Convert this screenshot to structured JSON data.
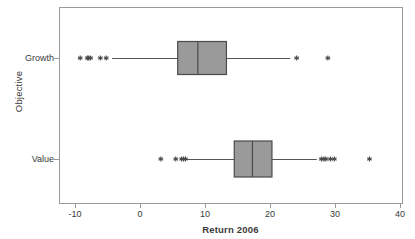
{
  "chart_data": {
    "type": "box",
    "title": "",
    "xlabel": "Return 2006",
    "ylabel": "Objective",
    "orientation": "horizontal",
    "grid": false,
    "legend": "none",
    "xlim": [
      -13,
      41
    ],
    "xticks": [
      -10,
      0,
      10,
      20,
      30,
      40
    ],
    "xtick_labels": [
      "-10",
      "0",
      "10",
      "20",
      "30",
      "40"
    ],
    "categories": [
      "Growth",
      "Value"
    ],
    "box_fill": "#9a9a9a",
    "box_edge": "#4a4a4a",
    "line_color": "#555555",
    "frame_color": "#9a9a9a",
    "boxes": [
      {
        "name": "Growth",
        "category": "Growth",
        "whisker_low": -4.3,
        "q1": 5.8,
        "median": 8.9,
        "q3": 13.3,
        "whisker_high": 23.1,
        "outliers_low": [
          -9.2,
          -8.1,
          -7.9,
          -7.6,
          -6.1,
          -5.2
        ],
        "outliers_high": [
          24.1,
          28.9
        ]
      },
      {
        "name": "Value",
        "category": "Value",
        "whisker_low": 7.0,
        "q1": 14.5,
        "median": 17.3,
        "q3": 20.3,
        "whisker_high": 27.2,
        "outliers_low": [
          3.2,
          5.5,
          6.4,
          6.7,
          7.0
        ],
        "outliers_high": [
          27.9,
          28.3,
          28.6,
          29.3,
          29.9,
          35.3
        ]
      }
    ]
  },
  "axes": {
    "x_title": "Return 2006",
    "y_title": "Objective",
    "x_tick_0": "-10",
    "x_tick_1": "0",
    "x_tick_2": "10",
    "x_tick_3": "20",
    "x_tick_4": "30",
    "x_tick_5": "40",
    "y_tick_0": "Growth",
    "y_tick_1": "Value"
  }
}
